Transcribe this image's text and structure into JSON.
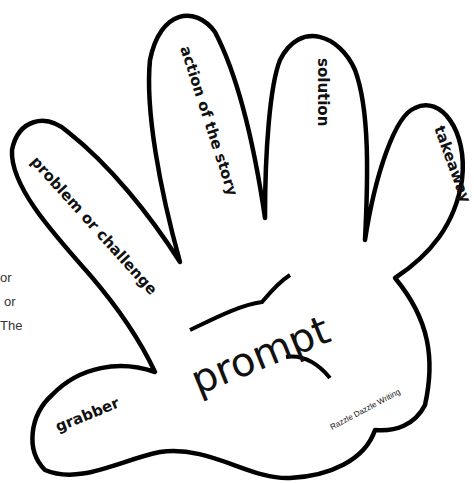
{
  "diagram": {
    "type": "hand-outline-graphic-organizer",
    "fingers": [
      {
        "position": "thumb",
        "label": "grabber"
      },
      {
        "position": "index",
        "label": "problem or challenge"
      },
      {
        "position": "middle",
        "label": "action of the story"
      },
      {
        "position": "ring",
        "label": "solution"
      },
      {
        "position": "pinky",
        "label": "takeaway"
      }
    ],
    "palm": {
      "label": "prompt"
    },
    "credit": "Razzle Dazzle Writing",
    "colors": {
      "outline": "#000000",
      "background": "#ffffff",
      "text": "#111111"
    }
  },
  "side_fragments": [
    "or",
    "or",
    "The"
  ]
}
